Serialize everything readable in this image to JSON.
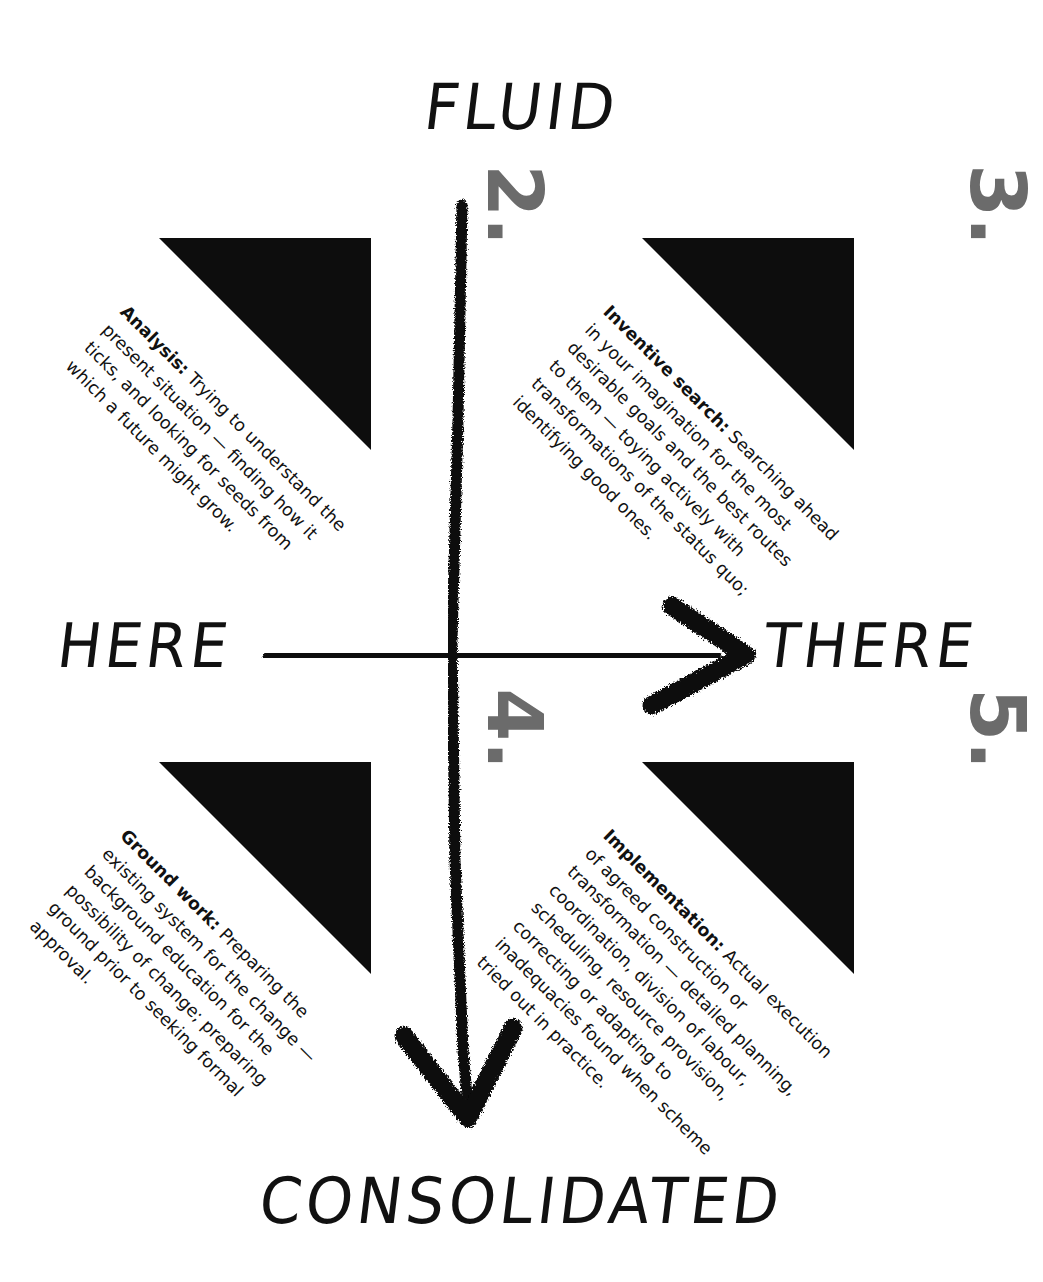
{
  "axes": {
    "top_label": "FLUID",
    "bottom_label": "CONSOLIDATED",
    "left_label": "HERE",
    "right_label": "THERE"
  },
  "colors": {
    "ink": "#111111",
    "triangle_fill": "#0d0d0d",
    "numeral_gray": "#6b6b6b",
    "heading_text": "#ffffff",
    "background": "#ffffff"
  },
  "quadrants": [
    {
      "number": "2.",
      "heading": "analysis",
      "term": "Analysis:",
      "body": " Trying to understand the present situation — finding how it ticks, and looking for seeds from which a future might grow.",
      "position": "top-left"
    },
    {
      "number": "3.",
      "heading": "inventive search",
      "term": "Inventive search:",
      "body": " Searching ahead in your imagination for the most desirable goals and the best routes to them — toying actively with transformations of the status quo; identifying good ones.",
      "position": "top-right"
    },
    {
      "number": "4.",
      "heading": "groundwork",
      "term": "Ground work:",
      "body": " Preparing the existing system for the change — background education for the possibility of change; preparing ground prior to seeking formal approval.",
      "position": "bottom-left"
    },
    {
      "number": "5.",
      "heading": "implementation",
      "term": "Implementation:",
      "body": " Actual execution of agreed construction or transformation — detailed planning, coordination, division of labour, scheduling, resource provision, correcting or adapting to inadequacies found when scheme tried out in practice.",
      "position": "bottom-right"
    }
  ]
}
